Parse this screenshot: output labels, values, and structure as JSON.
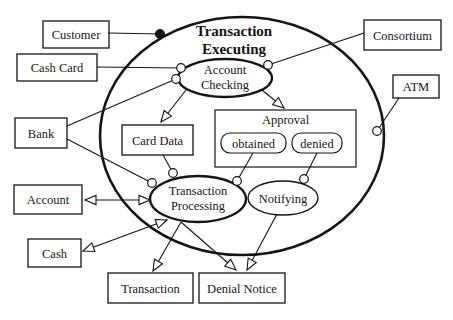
{
  "figure": {
    "background": "#ffffff",
    "ink": "#151515",
    "node_fill": "#ffffff",
    "title": {
      "lines": [
        "Transaction",
        "Executing"
      ],
      "x": 234,
      "baselines": [
        36,
        54
      ]
    },
    "outer_ellipse": {
      "id": "transaction-executing-boundary",
      "cx": 242,
      "cy": 136,
      "rx": 142,
      "ry": 119,
      "stroke_width": 2.6
    },
    "state_ellipses": [
      {
        "id": "account-checking",
        "lines": [
          "Account",
          "Checking"
        ],
        "cx": 225,
        "cy": 78,
        "rx": 47,
        "ry": 19,
        "stroke_width": 2.3
      },
      {
        "id": "transaction-processing",
        "lines": [
          "Transaction",
          "Processing"
        ],
        "cx": 198,
        "cy": 199,
        "rx": 48,
        "ry": 23,
        "stroke_width": 2.3
      },
      {
        "id": "notifying",
        "lines": [
          "Notifying"
        ],
        "cx": 283,
        "cy": 198,
        "rx": 35,
        "ry": 17,
        "stroke_width": 1.4
      }
    ],
    "boxes": [
      {
        "id": "customer",
        "label": "Customer",
        "x": 43,
        "y": 21,
        "w": 66,
        "h": 27
      },
      {
        "id": "cash-card",
        "label": "Cash Card",
        "x": 17,
        "y": 54,
        "w": 80,
        "h": 27
      },
      {
        "id": "bank",
        "label": "Bank",
        "x": 15,
        "y": 118,
        "w": 52,
        "h": 30
      },
      {
        "id": "account",
        "label": "Account",
        "x": 14,
        "y": 185,
        "w": 68,
        "h": 29
      },
      {
        "id": "cash",
        "label": "Cash",
        "x": 28,
        "y": 239,
        "w": 53,
        "h": 28
      },
      {
        "id": "consortium",
        "label": "Consortium",
        "x": 364,
        "y": 20,
        "w": 77,
        "h": 30
      },
      {
        "id": "atm",
        "label": "ATM",
        "x": 393,
        "y": 75,
        "w": 46,
        "h": 23
      },
      {
        "id": "card-data",
        "label": "Card Data",
        "x": 122,
        "y": 125,
        "w": 71,
        "h": 30
      },
      {
        "id": "transaction",
        "label": "Transaction",
        "x": 108,
        "y": 273,
        "w": 85,
        "h": 30
      },
      {
        "id": "denial-notice",
        "label": "Denial Notice",
        "x": 199,
        "y": 273,
        "w": 86,
        "h": 30
      }
    ],
    "approval_group": {
      "id": "approval",
      "label": "Approval",
      "x": 215,
      "y": 110,
      "w": 141,
      "h": 57,
      "label_baseline": 124,
      "substates": [
        {
          "id": "obtained",
          "label": "obtained",
          "x": 221,
          "y": 133,
          "w": 65,
          "h": 20,
          "r": 9
        },
        {
          "id": "denied",
          "label": "denied",
          "x": 292,
          "y": 133,
          "w": 50,
          "h": 20,
          "r": 9
        }
      ]
    },
    "connectors": [
      {
        "id": "customer-to-executing",
        "x1": 108,
        "y1": 33,
        "x2": 160,
        "y2": 34,
        "end": "dot"
      },
      {
        "id": "cashcard-to-checking",
        "x1": 97,
        "y1": 67,
        "x2": 181,
        "y2": 68,
        "end": "circle"
      },
      {
        "id": "bank-to-checking",
        "x1": 67,
        "y1": 126,
        "x2": 176,
        "y2": 79,
        "end": "circle"
      },
      {
        "id": "bank-to-processing",
        "x1": 67,
        "y1": 139,
        "x2": 152,
        "y2": 183,
        "end": "circle"
      },
      {
        "id": "carddata-to-processing",
        "x1": 163,
        "y1": 155,
        "x2": 173,
        "y2": 173,
        "end": "circle"
      },
      {
        "id": "consortium-to-checking",
        "x1": 364,
        "y1": 33,
        "x2": 268,
        "y2": 65,
        "end": "circle"
      },
      {
        "id": "atm-to-executing",
        "x1": 399,
        "y1": 98,
        "x2": 377,
        "y2": 131,
        "end": "circle"
      },
      {
        "id": "obtained-to-processing",
        "x1": 253,
        "y1": 153,
        "x2": 237,
        "y2": 181,
        "end": "circle"
      },
      {
        "id": "denied-to-notifying",
        "x1": 317,
        "y1": 153,
        "x2": 304,
        "y2": 179,
        "end": "circle"
      },
      {
        "id": "checking-to-carddata",
        "x1": 186,
        "y1": 90,
        "x2": 161,
        "y2": 122,
        "end": "arrow"
      },
      {
        "id": "checking-to-approval",
        "x1": 262,
        "y1": 90,
        "x2": 284,
        "y2": 108,
        "end": "arrow"
      },
      {
        "id": "processing-account",
        "x1": 150,
        "y1": 200,
        "x2": 85,
        "y2": 200,
        "end": "arrow",
        "start": "arrow"
      },
      {
        "id": "processing-cash",
        "x1": 167,
        "y1": 220,
        "x2": 83,
        "y2": 251,
        "end": "arrow",
        "start": "arrow"
      },
      {
        "id": "processing-to-transaction",
        "x1": 181,
        "y1": 222,
        "x2": 153,
        "y2": 271,
        "end": "arrow"
      },
      {
        "id": "processing-to-denialnotice",
        "x1": 181,
        "y1": 222,
        "x2": 236,
        "y2": 270,
        "end": "arrow"
      },
      {
        "id": "notifying-to-denialnotice",
        "x1": 277,
        "y1": 214,
        "x2": 247,
        "y2": 270,
        "end": "arrow"
      }
    ]
  }
}
